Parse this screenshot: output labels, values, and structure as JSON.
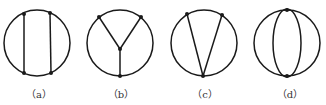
{
  "figure": {
    "panels": [
      {
        "id": "a",
        "label": "（a）",
        "description": "circle with two vertical chords",
        "vertices": 4
      },
      {
        "id": "b",
        "label": "（b）",
        "description": "circle with Y-shaped internal tree (three edges meeting at interior vertex)",
        "vertices": 4
      },
      {
        "id": "c",
        "label": "（c）",
        "description": "circle with V shape: two chords from bottom point to two top points",
        "vertices": 3
      },
      {
        "id": "d",
        "label": "（d）",
        "description": "circle with two inner arcs joining top and bottom points (lens)",
        "vertices": 2
      }
    ],
    "colors": {
      "line": "#1a1a1a",
      "label": "#333333",
      "background": "#ffffff"
    }
  }
}
